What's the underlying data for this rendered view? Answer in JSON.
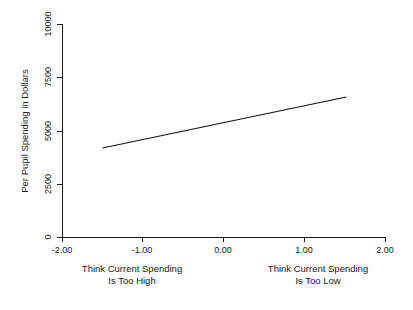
{
  "chart_data": {
    "type": "line",
    "title": "",
    "subtitle": "",
    "xlabel": "",
    "ylabel": "Per Pupil Spending in Dollars",
    "xlim": [
      -2.0,
      2.0
    ],
    "ylim": [
      0,
      10000
    ],
    "grid": false,
    "legend": false,
    "legend_position": "none",
    "x_ticks": [
      -2.0,
      -1.0,
      0.0,
      1.0,
      2.0
    ],
    "x_tick_labels": [
      "-2.00",
      "-1.00",
      "0.00",
      "1.00",
      "2.00"
    ],
    "y_ticks": [
      0,
      2500,
      5000,
      7500,
      10000
    ],
    "y_tick_labels": [
      "0",
      "2500",
      "5000",
      "7500",
      "10000"
    ],
    "series": [
      {
        "name": "Predicted per pupil spending",
        "x": [
          -1.5,
          1.52
        ],
        "values": [
          4180,
          6570
        ]
      }
    ],
    "annotations": [
      {
        "name": "left-axis-annotation",
        "line1": "Think Current Spending",
        "line2": "Is Too High",
        "x": -1.0
      },
      {
        "name": "right-axis-annotation",
        "line1": "Think Current Spending",
        "line2": "Is Too Low",
        "x": 1.0
      }
    ],
    "colors": {
      "line": "#111111",
      "axis": "#1a1a1a",
      "text": "#1a1a1a",
      "background": "#ffffff"
    }
  }
}
